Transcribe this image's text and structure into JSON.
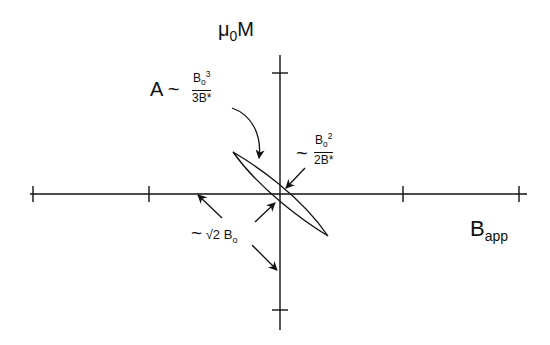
{
  "diagram": {
    "type": "hysteresis-loop",
    "y_axis_label": {
      "base": "μ",
      "sub": "0",
      "tail": "M"
    },
    "x_axis_label": {
      "base": "B",
      "sub": "app"
    },
    "area_label": {
      "prefix": "A ~",
      "numerator_base": "B",
      "numerator_sub": "o",
      "numerator_sup": "3",
      "denominator": "3B*"
    },
    "remanence_label": {
      "prefix": "~",
      "numerator_base": "B",
      "numerator_sub": "o",
      "numerator_sup": "2",
      "denominator": "2B*"
    },
    "width_label": {
      "prefix": "~",
      "root": "√2",
      "base": "B",
      "sub": "o"
    },
    "colors": {
      "ink": "#111111",
      "background": "#ffffff"
    }
  }
}
